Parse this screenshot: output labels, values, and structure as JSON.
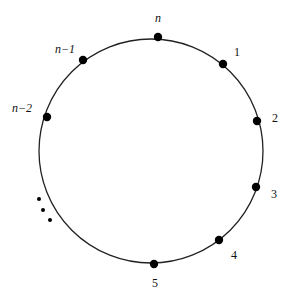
{
  "diagram": {
    "type": "circular-arrangement",
    "circle": {
      "cx": 151,
      "cy": 151,
      "r": 112,
      "stroke": "#222222"
    },
    "nodes": [
      {
        "id": "n",
        "label": "n",
        "italic": true,
        "x": 158,
        "y": 37,
        "lx": 158,
        "ly": 22,
        "anchor": "middle"
      },
      {
        "id": "1",
        "label": "1",
        "italic": false,
        "x": 223,
        "y": 64,
        "lx": 237,
        "ly": 56,
        "anchor": "middle"
      },
      {
        "id": "2",
        "label": "2",
        "italic": false,
        "x": 257,
        "y": 121,
        "lx": 275,
        "ly": 122,
        "anchor": "middle"
      },
      {
        "id": "3",
        "label": "3",
        "italic": false,
        "x": 256,
        "y": 187,
        "lx": 274,
        "ly": 198,
        "anchor": "middle"
      },
      {
        "id": "4",
        "label": "4",
        "italic": false,
        "x": 219,
        "y": 240,
        "lx": 234,
        "ly": 259,
        "anchor": "middle"
      },
      {
        "id": "5",
        "label": "5",
        "italic": false,
        "x": 154,
        "y": 264,
        "lx": 155,
        "ly": 287,
        "anchor": "middle"
      },
      {
        "id": "n-1",
        "label": "n−1",
        "italic": true,
        "x": 83,
        "y": 60,
        "lx": 65,
        "ly": 53,
        "anchor": "middle"
      },
      {
        "id": "n-2",
        "label": "n−2",
        "italic": true,
        "x": 47,
        "y": 117,
        "lx": 22,
        "ly": 112,
        "anchor": "middle"
      }
    ],
    "ellipsis_dots": [
      {
        "x": 39,
        "y": 199
      },
      {
        "x": 43,
        "y": 210
      },
      {
        "x": 50,
        "y": 220
      }
    ],
    "node_color": "#000000"
  }
}
